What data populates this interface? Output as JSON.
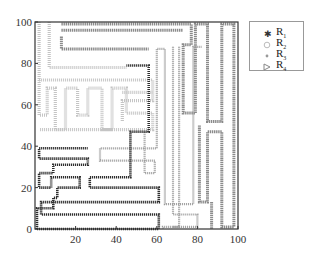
{
  "chart_data": {
    "type": "line",
    "title": "",
    "xlabel": "",
    "ylabel": "",
    "xlim": [
      0,
      100
    ],
    "ylim": [
      0,
      100
    ],
    "x_ticks": [
      "20",
      "40",
      "60",
      "80",
      "100"
    ],
    "y_ticks": [
      "0",
      "20",
      "40",
      "60",
      "80",
      "100"
    ],
    "grid": false,
    "legend_position": "upper right outside",
    "series": [
      {
        "name": "R1",
        "marker": "star",
        "color": "#333333",
        "paths": [
          [
            [
              1,
              0
            ],
            [
              61,
              0
            ],
            [
              61,
              7
            ],
            [
              3,
              7
            ],
            [
              3,
              13
            ],
            [
              61,
              13
            ],
            [
              61,
              20
            ],
            [
              27,
              20
            ],
            [
              27,
              25
            ],
            [
              47,
              25
            ],
            [
              47,
              47
            ],
            [
              56,
              47
            ],
            [
              56,
              79
            ],
            [
              45,
              79
            ]
          ],
          [
            [
              1,
              0
            ],
            [
              1,
              10
            ],
            [
              9,
              10
            ],
            [
              9,
              15
            ],
            [
              11,
              15
            ],
            [
              11,
              20
            ],
            [
              22,
              20
            ],
            [
              22,
              25
            ],
            [
              8,
              25
            ],
            [
              8,
              20
            ],
            [
              2,
              20
            ],
            [
              2,
              27
            ],
            [
              9,
              27
            ],
            [
              9,
              31
            ],
            [
              26,
              31
            ],
            [
              26,
              34
            ],
            [
              2,
              34
            ],
            [
              2,
              39
            ],
            [
              26,
              39
            ]
          ]
        ]
      },
      {
        "name": "R2",
        "marker": "circle-open",
        "color": "#bbbbbb",
        "paths": [
          [
            [
              2,
              100
            ],
            [
              2,
              55
            ],
            [
              6,
              55
            ],
            [
              6,
              68
            ],
            [
              10,
              68
            ],
            [
              10,
              48
            ],
            [
              15,
              48
            ],
            [
              15,
              68
            ],
            [
              21,
              68
            ],
            [
              21,
              55
            ],
            [
              26,
              55
            ],
            [
              26,
              68
            ],
            [
              33,
              68
            ],
            [
              33,
              48
            ],
            [
              38,
              48
            ],
            [
              38,
              68
            ],
            [
              45,
              68
            ],
            [
              45,
              56
            ],
            [
              58,
              56
            ],
            [
              58,
              48
            ],
            [
              2,
              48
            ]
          ],
          [
            [
              7,
              100
            ],
            [
              7,
              78
            ],
            [
              45,
              78
            ]
          ],
          [
            [
              2,
              72
            ],
            [
              58,
              72
            ],
            [
              58,
              62
            ],
            [
              43,
              62
            ],
            [
              43,
              52
            ]
          ],
          [
            [
              43,
              66
            ],
            [
              58,
              66
            ]
          ]
        ]
      },
      {
        "name": "R3",
        "marker": "dot",
        "color": "#999999",
        "paths": [
          [
            [
              54,
              47
            ],
            [
              54,
              27
            ],
            [
              59,
              27
            ],
            [
              59,
              33
            ],
            [
              32,
              33
            ],
            [
              32,
              39
            ],
            [
              60,
              39
            ],
            [
              60,
              53
            ],
            [
              60,
              87
            ],
            [
              64,
              87
            ],
            [
              64,
              12
            ],
            [
              78,
              12
            ],
            [
              78,
              88
            ],
            [
              82,
              88
            ]
          ],
          [
            [
              71,
              88
            ],
            [
              71,
              1
            ],
            [
              63,
              1
            ],
            [
              63,
              0
            ]
          ],
          [
            [
              68,
              88
            ],
            [
              68,
              7
            ],
            [
              80,
              7
            ],
            [
              80,
              1
            ],
            [
              68,
              1
            ]
          ]
        ]
      },
      {
        "name": "R4",
        "marker": "triangle-right",
        "color": "#888888",
        "paths": [
          [
            [
              13,
              99
            ],
            [
              77,
              99
            ],
            [
              77,
              89
            ],
            [
              73,
              89
            ],
            [
              73,
              56
            ],
            [
              79,
              56
            ],
            [
              79,
              99
            ],
            [
              85,
              99
            ],
            [
              85,
              52
            ],
            [
              92,
              52
            ],
            [
              92,
              99
            ],
            [
              98,
              99
            ],
            [
              98,
              1
            ],
            [
              92,
              1
            ],
            [
              92,
              47
            ],
            [
              85,
              47
            ],
            [
              85,
              13
            ],
            [
              81,
              13
            ],
            [
              81,
              50
            ]
          ],
          [
            [
              13,
              96
            ],
            [
              73,
              96
            ]
          ],
          [
            [
              13,
              93
            ],
            [
              13,
              87
            ],
            [
              56,
              87
            ]
          ],
          [
            [
              87,
              13
            ],
            [
              87,
              0
            ]
          ]
        ]
      }
    ]
  },
  "legend": {
    "items": [
      {
        "label": "R",
        "sub": "1"
      },
      {
        "label": "R",
        "sub": "2"
      },
      {
        "label": "R",
        "sub": "3"
      },
      {
        "label": "R",
        "sub": "4"
      }
    ]
  }
}
